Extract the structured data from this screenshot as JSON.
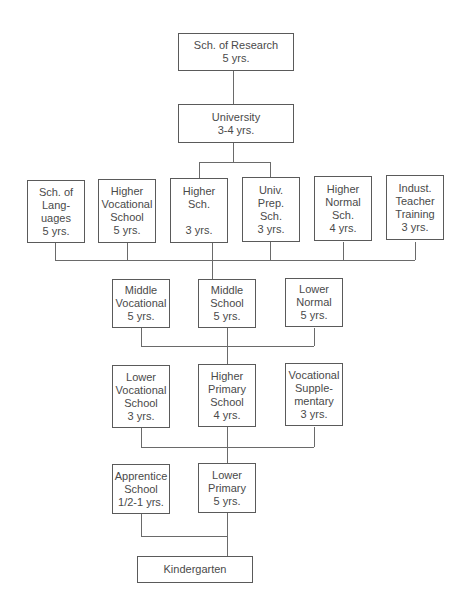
{
  "diagram": {
    "type": "education-system-hierarchy",
    "nodes": {
      "research": {
        "lines": [
          "Sch. of Research",
          "5 yrs."
        ]
      },
      "university": {
        "lines": [
          "University",
          "3-4 yrs."
        ]
      },
      "languages": {
        "lines": [
          "Sch. of",
          "Lang-",
          "uages",
          "5 yrs."
        ]
      },
      "higher_vocational": {
        "lines": [
          "Higher",
          "Vocational",
          "School",
          "5 yrs."
        ]
      },
      "higher_sch": {
        "lines": [
          "Higher",
          "Sch.",
          "",
          "3 yrs."
        ]
      },
      "univ_prep": {
        "lines": [
          "Univ.",
          "Prep.",
          "Sch.",
          "3 yrs."
        ]
      },
      "higher_normal": {
        "lines": [
          "Higher",
          "Normal",
          "Sch.",
          "4 yrs."
        ]
      },
      "indust_teacher": {
        "lines": [
          "Indust.",
          "Teacher",
          "Training",
          "3 yrs."
        ]
      },
      "middle_vocational": {
        "lines": [
          "Middle",
          "Vocational",
          "5 yrs."
        ]
      },
      "middle_school": {
        "lines": [
          "Middle",
          "School",
          "5 yrs."
        ]
      },
      "lower_normal": {
        "lines": [
          "Lower",
          "Normal",
          "5 yrs."
        ]
      },
      "lower_vocational": {
        "lines": [
          "Lower",
          "Vocational",
          "School",
          "3 yrs."
        ]
      },
      "higher_primary": {
        "lines": [
          "Higher",
          "Primary",
          "School",
          "4 yrs."
        ]
      },
      "vocational_supp": {
        "lines": [
          "Vocational",
          "Supple-",
          "mentary",
          "3 yrs."
        ]
      },
      "apprentice": {
        "lines": [
          "Apprentice",
          "School",
          "1/2-1 yrs."
        ]
      },
      "lower_primary": {
        "lines": [
          "Lower",
          "Primary",
          "5 yrs."
        ]
      },
      "kindergarten": {
        "lines": [
          "Kindergarten"
        ]
      }
    },
    "edges": [
      [
        "university",
        "research"
      ],
      [
        "higher_sch",
        "university"
      ],
      [
        "univ_prep",
        "university"
      ],
      [
        "middle_school",
        "languages"
      ],
      [
        "middle_school",
        "higher_vocational"
      ],
      [
        "middle_school",
        "higher_sch"
      ],
      [
        "middle_school",
        "univ_prep"
      ],
      [
        "middle_school",
        "higher_normal"
      ],
      [
        "middle_school",
        "indust_teacher"
      ],
      [
        "higher_primary",
        "middle_vocational"
      ],
      [
        "higher_primary",
        "middle_school"
      ],
      [
        "higher_primary",
        "lower_normal"
      ],
      [
        "lower_primary",
        "lower_vocational"
      ],
      [
        "lower_primary",
        "higher_primary"
      ],
      [
        "lower_primary",
        "vocational_supp"
      ],
      [
        "kindergarten",
        "apprentice"
      ],
      [
        "kindergarten",
        "lower_primary"
      ]
    ]
  }
}
